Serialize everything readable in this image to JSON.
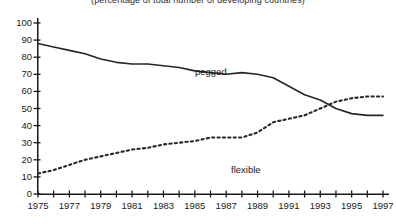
{
  "chart_data": {
    "type": "line",
    "title": "",
    "subtitle": "(percentage of total number of developing countries)",
    "xlabel": "",
    "ylabel": "",
    "xlim": [
      1975,
      1997
    ],
    "ylim": [
      0,
      100
    ],
    "grid": false,
    "legend_position": "in-plot-annotations",
    "x": [
      1975,
      1976,
      1977,
      1978,
      1979,
      1980,
      1981,
      1982,
      1983,
      1984,
      1985,
      1986,
      1987,
      1988,
      1989,
      1990,
      1991,
      1992,
      1993,
      1994,
      1995,
      1996,
      1997
    ],
    "x_tick_labels": [
      "1975",
      "1977",
      "1979",
      "1981",
      "1983",
      "1985",
      "1987",
      "1989",
      "1991",
      "1993",
      "1995",
      "1997"
    ],
    "x_tick_values": [
      1975,
      1977,
      1979,
      1981,
      1983,
      1985,
      1987,
      1989,
      1991,
      1993,
      1995,
      1997
    ],
    "x_minor_tick_values": [
      1975,
      1976,
      1977,
      1978,
      1979,
      1980,
      1981,
      1982,
      1983,
      1984,
      1985,
      1986,
      1987,
      1988,
      1989,
      1990,
      1991,
      1992,
      1993,
      1994,
      1995,
      1996,
      1997
    ],
    "y_tick_labels": [
      "100",
      "90",
      "80",
      "70",
      "60",
      "50",
      "40",
      "30",
      "20",
      "10",
      "0"
    ],
    "y_tick_values": [
      100,
      90,
      80,
      70,
      60,
      50,
      40,
      30,
      20,
      10,
      0
    ],
    "series": [
      {
        "name": "pegged",
        "style": "solid",
        "color": "#262626",
        "annotation": "pegged",
        "values": [
          88,
          86,
          84,
          82,
          79,
          77,
          76,
          76,
          75,
          74,
          72,
          71,
          70,
          71,
          70,
          68,
          63,
          58,
          55,
          50,
          47,
          46,
          46
        ]
      },
      {
        "name": "flexible",
        "style": "dotted",
        "color": "#262626",
        "annotation": "flexible",
        "values": [
          12,
          14,
          17,
          20,
          22,
          24,
          26,
          27,
          29,
          30,
          31,
          33,
          33,
          33,
          36,
          42,
          44,
          46,
          50,
          54,
          56,
          57,
          57
        ]
      }
    ]
  },
  "axes": {
    "axis_color": "#1a1a1a"
  }
}
